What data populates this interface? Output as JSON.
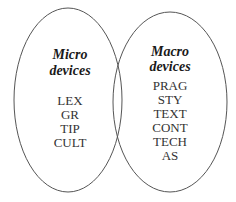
{
  "diagram": {
    "type": "venn",
    "stroke_color": "#555555",
    "left_set": {
      "title_line1": "Micro",
      "title_line2": "devices",
      "items": [
        "LEX",
        "GR",
        "TIP",
        "CULT"
      ]
    },
    "right_set": {
      "title_line1": "Macro",
      "title_line2": "devices",
      "items": [
        "PRAG",
        "STY",
        "TEXT",
        "CONT",
        "TECH",
        "AS"
      ]
    }
  }
}
